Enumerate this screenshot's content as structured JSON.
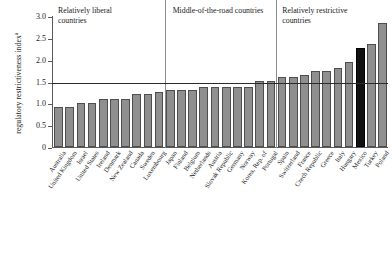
{
  "chart_data": {
    "type": "bar",
    "title": "",
    "xlabel": "",
    "ylabel": "regulatory restrictiveness index",
    "ylabel_superscript": "a",
    "ylim": [
      0,
      3.0
    ],
    "yticks": [
      "0",
      "0.5",
      "1.0",
      "1.5",
      "2.0",
      "2.5",
      "3.0"
    ],
    "ytick_values": [
      0,
      0.5,
      1.0,
      1.5,
      2.0,
      2.5,
      3.0
    ],
    "grid": false,
    "legend": "none",
    "reference_line": {
      "value": 1.5,
      "label": ""
    },
    "highlight_color": "#111111",
    "bar_color": "#8f8f8f",
    "categories": [
      "Australia",
      "United Kingdom",
      "Israel",
      "United States",
      "Ireland",
      "Denmark",
      "New Zealand",
      "Canada",
      "Sweden",
      "Luxembourg",
      "Japan",
      "Finland",
      "Belgium",
      "Netherlands",
      "Austria",
      "Slovak Republic",
      "Germany",
      "Norway",
      "Korea, Rep. of",
      "Portugal",
      "Spain",
      "Switzerland",
      "France",
      "Czech Republic",
      "Greece",
      "Italy",
      "Hungary",
      "Mexico",
      "Turkey",
      "Poland"
    ],
    "values": [
      0.91,
      0.91,
      1.0,
      1.0,
      1.1,
      1.1,
      1.1,
      1.21,
      1.21,
      1.25,
      1.31,
      1.31,
      1.31,
      1.37,
      1.37,
      1.37,
      1.37,
      1.37,
      1.51,
      1.51,
      1.6,
      1.6,
      1.66,
      1.73,
      1.73,
      1.81,
      1.94,
      2.26,
      2.35,
      2.85
    ],
    "highlighted": [
      "Mexico"
    ],
    "groups": [
      {
        "label": "Relatively liberal countries",
        "start": 0,
        "end": 9
      },
      {
        "label": "Middle-of-the-road countries",
        "start": 10,
        "end": 19
      },
      {
        "label": "Relatively restrictive countries",
        "start": 20,
        "end": 29
      }
    ],
    "dividers": [
      10,
      20
    ]
  }
}
